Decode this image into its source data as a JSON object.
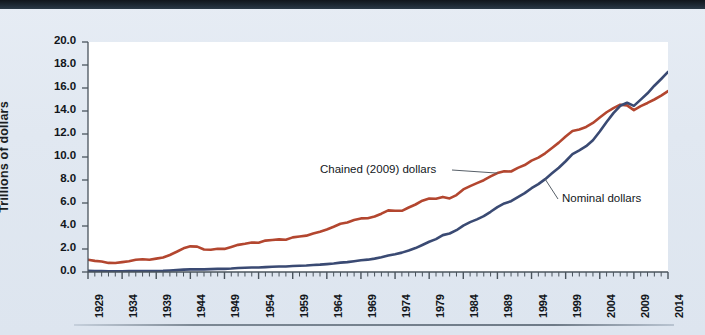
{
  "figure": {
    "background_color": "#e1e8f1",
    "plot_background_color": "#ffffff",
    "top_bar_color": "#1d2833"
  },
  "chart_data": {
    "type": "line",
    "title": "",
    "subtitle": "",
    "xlabel": "",
    "ylabel": "Trillions of dollars",
    "xlim": [
      1929,
      2014
    ],
    "ylim": [
      0.0,
      20.0
    ],
    "grid": false,
    "legend_position": "inline-annotations",
    "ytick_labels": [
      "0.0",
      "2.0",
      "4.0",
      "6.0",
      "8.0",
      "10.0",
      "12.0",
      "14.0",
      "16.0",
      "18.0",
      "20.0"
    ],
    "ytick_values": [
      0.0,
      2.0,
      4.0,
      6.0,
      8.0,
      10.0,
      12.0,
      14.0,
      16.0,
      18.0,
      20.0
    ],
    "xtick_labels": [
      "1929",
      "1934",
      "1939",
      "1944",
      "1949",
      "1954",
      "1959",
      "1964",
      "1969",
      "1974",
      "1979",
      "1984",
      "1989",
      "1994",
      "1999",
      "2004",
      "2009",
      "2014"
    ],
    "xtick_values": [
      1929,
      1934,
      1939,
      1944,
      1949,
      1954,
      1959,
      1964,
      1969,
      1974,
      1979,
      1984,
      1989,
      1994,
      1999,
      2004,
      2009,
      2014
    ],
    "minor_tick_interval": 1,
    "annotations": [
      {
        "text": "Chained (2009) dollars",
        "series": "Chained (2009) dollars",
        "points_to_year": 1989
      },
      {
        "text": "Nominal dollars",
        "series": "Nominal dollars",
        "points_to_year": 1996
      }
    ],
    "x": [
      1929,
      1930,
      1931,
      1932,
      1933,
      1934,
      1935,
      1936,
      1937,
      1938,
      1939,
      1940,
      1941,
      1942,
      1943,
      1944,
      1945,
      1946,
      1947,
      1948,
      1949,
      1950,
      1951,
      1952,
      1953,
      1954,
      1955,
      1956,
      1957,
      1958,
      1959,
      1960,
      1961,
      1962,
      1963,
      1964,
      1965,
      1966,
      1967,
      1968,
      1969,
      1970,
      1971,
      1972,
      1973,
      1974,
      1975,
      1976,
      1977,
      1978,
      1979,
      1980,
      1981,
      1982,
      1983,
      1984,
      1985,
      1986,
      1987,
      1988,
      1989,
      1990,
      1991,
      1992,
      1993,
      1994,
      1995,
      1996,
      1997,
      1998,
      1999,
      2000,
      2001,
      2002,
      2003,
      2004,
      2005,
      2006,
      2007,
      2008,
      2009,
      2010,
      2011,
      2012,
      2013,
      2014
    ],
    "series": [
      {
        "name": "Chained (2009) dollars",
        "color": "#b3462f",
        "values": [
          1.06,
          0.97,
          0.91,
          0.79,
          0.78,
          0.86,
          0.94,
          1.06,
          1.11,
          1.07,
          1.16,
          1.26,
          1.48,
          1.76,
          2.06,
          2.23,
          2.21,
          1.96,
          1.94,
          2.02,
          2.01,
          2.18,
          2.36,
          2.45,
          2.56,
          2.55,
          2.73,
          2.78,
          2.84,
          2.81,
          3.01,
          3.08,
          3.16,
          3.35,
          3.5,
          3.7,
          3.94,
          4.2,
          4.31,
          4.52,
          4.66,
          4.67,
          4.82,
          5.07,
          5.36,
          5.33,
          5.32,
          5.61,
          5.87,
          6.2,
          6.39,
          6.37,
          6.53,
          6.4,
          6.69,
          7.18,
          7.47,
          7.73,
          7.98,
          8.31,
          8.6,
          8.76,
          8.74,
          9.05,
          9.3,
          9.68,
          9.95,
          10.32,
          10.78,
          11.25,
          11.78,
          12.26,
          12.39,
          12.61,
          12.96,
          13.44,
          13.89,
          14.25,
          14.55,
          14.49,
          14.08,
          14.42,
          14.7,
          15.0,
          15.34,
          15.73
        ],
        "style": "solid",
        "width": 2.6
      },
      {
        "name": "Nominal dollars",
        "color": "#3a4a73",
        "values": [
          0.105,
          0.092,
          0.077,
          0.06,
          0.057,
          0.067,
          0.074,
          0.085,
          0.093,
          0.087,
          0.093,
          0.103,
          0.129,
          0.166,
          0.203,
          0.224,
          0.228,
          0.228,
          0.25,
          0.275,
          0.273,
          0.3,
          0.347,
          0.367,
          0.389,
          0.391,
          0.426,
          0.45,
          0.474,
          0.482,
          0.522,
          0.543,
          0.563,
          0.605,
          0.638,
          0.685,
          0.742,
          0.813,
          0.86,
          0.94,
          1.018,
          1.073,
          1.165,
          1.279,
          1.426,
          1.545,
          1.685,
          1.873,
          2.082,
          2.352,
          2.627,
          2.857,
          3.207,
          3.344,
          3.635,
          4.038,
          4.339,
          4.58,
          4.855,
          5.236,
          5.642,
          5.963,
          6.158,
          6.52,
          6.859,
          7.287,
          7.64,
          8.073,
          8.578,
          9.063,
          9.631,
          10.252,
          10.582,
          10.936,
          11.458,
          12.214,
          13.037,
          13.815,
          14.452,
          14.713,
          14.449,
          14.992,
          15.543,
          16.197,
          16.785,
          17.393
        ],
        "style": "solid",
        "width": 2.6
      }
    ]
  }
}
